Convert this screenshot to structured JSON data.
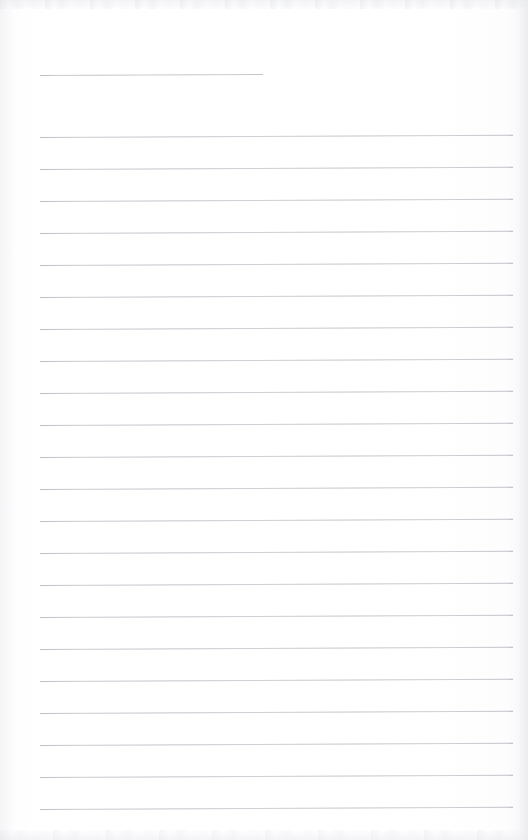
{
  "document": {
    "kind": "scanned-ruled-notepad-page",
    "title": "Blank Ruled Notepad Page",
    "content_text": "",
    "page_width": 528,
    "page_height": 840,
    "paper_color": "#fefefe",
    "rule_color": "#c9ccd1",
    "edge_shadow_color": "#e9eaee",
    "is_blank": true,
    "visible_text": []
  },
  "ruling": {
    "style": "college-ruled",
    "rule_spacing_px": 32,
    "rule_thickness_px": 1,
    "rule_tilt_deg": -0.27,
    "left_margin_x": 40,
    "right_margin_x": 513,
    "rule_count": 22,
    "header_rule": {
      "label": "header-rule",
      "y": 75,
      "x_start": 40,
      "x_end": 263,
      "width": 223
    },
    "rules": [
      {
        "index": 1,
        "y": 137,
        "x_start": 40,
        "x_end": 513
      },
      {
        "index": 2,
        "y": 169,
        "x_start": 40,
        "x_end": 513
      },
      {
        "index": 3,
        "y": 201,
        "x_start": 40,
        "x_end": 513
      },
      {
        "index": 4,
        "y": 233,
        "x_start": 40,
        "x_end": 513
      },
      {
        "index": 5,
        "y": 265,
        "x_start": 40,
        "x_end": 513
      },
      {
        "index": 6,
        "y": 297,
        "x_start": 40,
        "x_end": 513
      },
      {
        "index": 7,
        "y": 329,
        "x_start": 40,
        "x_end": 513
      },
      {
        "index": 8,
        "y": 361,
        "x_start": 40,
        "x_end": 513
      },
      {
        "index": 9,
        "y": 393,
        "x_start": 40,
        "x_end": 513
      },
      {
        "index": 10,
        "y": 425,
        "x_start": 40,
        "x_end": 513
      },
      {
        "index": 11,
        "y": 457,
        "x_start": 40,
        "x_end": 513
      },
      {
        "index": 12,
        "y": 489,
        "x_start": 40,
        "x_end": 513
      },
      {
        "index": 13,
        "y": 521,
        "x_start": 40,
        "x_end": 513
      },
      {
        "index": 14,
        "y": 553,
        "x_start": 40,
        "x_end": 513
      },
      {
        "index": 15,
        "y": 585,
        "x_start": 40,
        "x_end": 513
      },
      {
        "index": 16,
        "y": 617,
        "x_start": 40,
        "x_end": 513
      },
      {
        "index": 17,
        "y": 649,
        "x_start": 40,
        "x_end": 513
      },
      {
        "index": 18,
        "y": 681,
        "x_start": 40,
        "x_end": 513
      },
      {
        "index": 19,
        "y": 713,
        "x_start": 40,
        "x_end": 513
      },
      {
        "index": 20,
        "y": 745,
        "x_start": 40,
        "x_end": 513
      },
      {
        "index": 21,
        "y": 777,
        "x_start": 40,
        "x_end": 513
      },
      {
        "index": 22,
        "y": 809,
        "x_start": 40,
        "x_end": 513
      }
    ]
  },
  "scan_artifacts": {
    "top_edge_band": {
      "height": 9,
      "color": "#e4e5e9"
    },
    "bottom_edge_band": {
      "height": 10,
      "color": "#e7e8ec"
    },
    "right_edge_band": {
      "width": 10,
      "color": "#e9eaee"
    },
    "left_edge_band": {
      "width": 16,
      "color": "#f0f1f3"
    }
  }
}
